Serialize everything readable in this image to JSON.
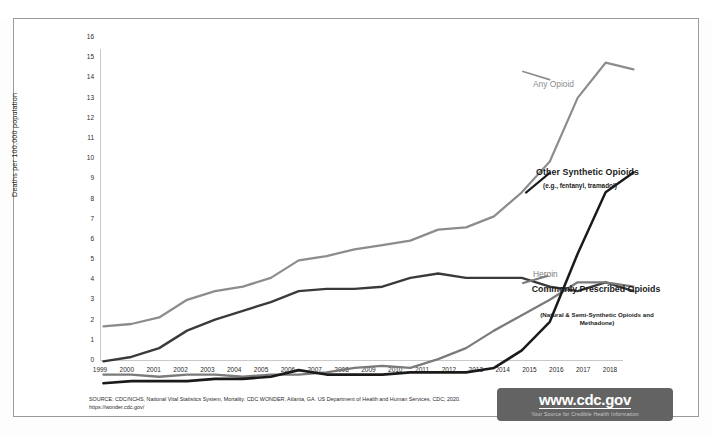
{
  "chart_data": {
    "type": "line",
    "title": "",
    "xlabel": "",
    "ylabel": "Deaths per 100,000 population",
    "xlim": [
      1999,
      2018
    ],
    "ylim": [
      0,
      16
    ],
    "ytick_step": 1,
    "grid": false,
    "legend_position": "inline-right-callouts",
    "x": [
      1999,
      2000,
      2001,
      2002,
      2003,
      2004,
      2005,
      2006,
      2007,
      2008,
      2009,
      2010,
      2011,
      2012,
      2013,
      2014,
      2015,
      2016,
      2017,
      2018
    ],
    "xticks": [
      "1999",
      "2000",
      "2001",
      "2002",
      "2003",
      "2004",
      "2005",
      "2006",
      "2007",
      "2008",
      "2009",
      "2010",
      "2011",
      "2012",
      "2013",
      "2014",
      "2015",
      "2016",
      "2017",
      "2018"
    ],
    "yticks": [
      "0",
      "1",
      "2",
      "3",
      "4",
      "5",
      "6",
      "7",
      "8",
      "9",
      "10",
      "11",
      "12",
      "13",
      "14",
      "15",
      "16"
    ],
    "series": [
      {
        "name": "Any Opioid",
        "color": "#8c8c8c",
        "values": [
          2.9,
          3.0,
          3.3,
          4.1,
          4.5,
          4.7,
          5.1,
          5.9,
          6.1,
          6.4,
          6.6,
          6.8,
          7.3,
          7.4,
          7.9,
          9.0,
          10.4,
          13.3,
          14.9,
          14.6
        ]
      },
      {
        "name": "Commonly Prescribed Opioids",
        "color": "#3a3a3a",
        "values": [
          1.3,
          1.5,
          1.9,
          2.7,
          3.2,
          3.6,
          4.0,
          4.5,
          4.6,
          4.6,
          4.7,
          5.1,
          5.3,
          5.1,
          5.1,
          5.1,
          4.7,
          4.5,
          4.9,
          4.5
        ]
      },
      {
        "name": "Heroin",
        "color": "#7a7a7a",
        "values": [
          0.7,
          0.7,
          0.6,
          0.7,
          0.7,
          0.6,
          0.7,
          0.7,
          0.8,
          1.0,
          1.1,
          1.0,
          1.4,
          1.9,
          2.7,
          3.4,
          4.1,
          4.9,
          4.9,
          4.7
        ]
      },
      {
        "name": "Other Synthetic Opioids",
        "color": "#1a1a1a",
        "values": [
          0.3,
          0.4,
          0.4,
          0.4,
          0.5,
          0.5,
          0.6,
          0.9,
          0.7,
          0.7,
          0.7,
          0.8,
          0.8,
          0.8,
          1.0,
          1.8,
          3.1,
          6.2,
          9.0,
          9.9
        ]
      }
    ]
  },
  "axis": {
    "y_title": "Deaths per 100,000 population"
  },
  "callouts": {
    "any_opioid": "Any Opioid",
    "other_synthetic": "Other Synthetic Opioids",
    "other_synthetic_sub": "(e.g., fentanyl, tramadol)",
    "heroin": "Heroin",
    "commonly_prescribed": "Commonly Prescribed Opioids",
    "commonly_prescribed_sub": "(Natural & Semi-Synthetic Opioids and Methadone)"
  },
  "footer": {
    "source_line1": "SOURCE: CDC/NCHS, National Vital Statistics System, Mortality. CDC WONDER, Atlanta, GA. US Department of Health and Human Services, CDC; 2020.",
    "source_line2": "https://wonder.cdc.gov/",
    "badge_url": "www.cdc.gov",
    "badge_tagline": "Your Source for Credible Health Information"
  },
  "colors": {
    "any_opioid": "#8c8c8c",
    "commonly_prescribed": "#3a3a3a",
    "heroin": "#7a7a7a",
    "other_synthetic": "#1a1a1a",
    "badge_bg": "#636363",
    "frame_border": "#9a9a9a"
  }
}
